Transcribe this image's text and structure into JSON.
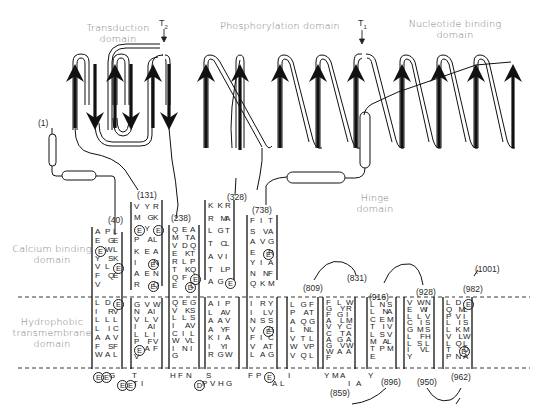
{
  "figure": {
    "type": "topology-diagram",
    "domains": {
      "transduction": "Transduction\ndomain",
      "phosphorylation": "Phosphorylation domain",
      "nucleotide_binding": "Nucleotide binding\ndomain",
      "hinge": "Hinge\ndomain",
      "calcium_binding": "Calcium binding\ndomain",
      "hydrophobic": "Hydrophobic\ntransmembrane\ndomain"
    },
    "labels": {
      "transduction_l1": "Transduction",
      "transduction_l2": "domain",
      "phosphorylation": "Phosphorylation domain",
      "nucleotide_l1": "Nucleotide binding",
      "nucleotide_l2": "domain",
      "hinge_l1": "Hinge",
      "hinge_l2": "domain",
      "calcium_l1": "Calcium binding",
      "calcium_l2": "domain",
      "hydro_l1": "Hydrophobic",
      "hydro_l2": "transmembrane",
      "hydro_l3": "domain"
    },
    "tryptic_sites": {
      "t2": "T",
      "t2_sub": "2",
      "t1": "T",
      "t1_sub": "1"
    },
    "residue_numbers": {
      "n1": "(1)",
      "n40": "(40)",
      "n131": "(131)",
      "n238": "(238)",
      "n328": "(328)",
      "n738": "(738)",
      "n809": "(809)",
      "n831": "(831)",
      "n859": "(859)",
      "n896": "(896)",
      "n916": "(916)",
      "n928": "(928)",
      "n950": "(950)",
      "n962": "(962)",
      "n982": "(982)",
      "n1001": "(1001)"
    },
    "transmembrane_helices": [
      {
        "id": "M1",
        "stalk_seq": "APLEGEEWLYSKVLEFQEV",
        "tm_seq": "LDEIR VLLLLICAAVFSFWAL",
        "below": "EEGEETI"
      },
      {
        "id": "M2",
        "stalk_seq": "VYRMGKEYEPALKEAIENAENREQ",
        "tm_seq": "GVWNAIVLVIAILLIPFVEAFV",
        "below": "T"
      },
      {
        "id": "M3",
        "stalk_seq": "QEAMTAVDQEKTRLPTKQQFEEDL",
        "tm_seq": "QEGVKSLLSIAVCILWVLINIG",
        "below": "HFNDPVHG"
      },
      {
        "id": "M4",
        "stalk_seq": "KKRRMALGTTCLAVITLPAGE",
        "tm_seq": "AIPLAVAAVAYFKIAIYIRGW",
        "below": "S"
      },
      {
        "id": "M5",
        "stalk_seq": "FITSVAAVGEERYIANNFQKM",
        "tm_seq": "IRYILVNSSVEGFICVATLAG",
        "below": "FPEAL"
      },
      {
        "id": "M6",
        "tm_seq": "LGFPATAQGLNLVTLWVPVQL",
        "below": "I"
      },
      {
        "id": "M7",
        "tm_seq": "FLWGYRFGIALMVYCCTAAGAGVWWAAF",
        "below": "YMAIA"
      },
      {
        "id": "M8",
        "tm_seq": "LNSLNACEMTIVLSVMALTPME",
        "below": "Y"
      },
      {
        "id": "M9",
        "tm_seq": "VWNEWILLVCISGMSLFHLSLIVLY",
        "below": ""
      },
      {
        "id": "M10",
        "tm_seq": "LDEQMLPVILISLKMVLWLQLTDDPNA",
        "below": ""
      }
    ],
    "legend": {
      "arrow_up": "beta strand (up)",
      "arrow_down": "beta strand (down)",
      "tube": "alpha helix",
      "circled_letter": "acidic residue (E/D)"
    }
  }
}
